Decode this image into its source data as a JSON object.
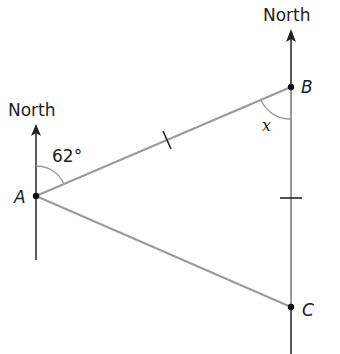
{
  "diagram": {
    "type": "bearing-triangle",
    "north_label_a": "North",
    "north_label_b": "North",
    "points": {
      "A": {
        "label": "A",
        "x": 36,
        "y": 196
      },
      "B": {
        "label": "B",
        "x": 291,
        "y": 87
      },
      "C": {
        "label": "C",
        "x": 291,
        "y": 307
      }
    },
    "angles": {
      "bearing_at_A": "62°",
      "angle_at_B": "x"
    },
    "tick_marks": [
      "AB",
      "BC"
    ],
    "colors": {
      "triangle_line": "#9a9a9a",
      "north_line": "#333333",
      "point": "#111111",
      "text": "#222222"
    }
  }
}
